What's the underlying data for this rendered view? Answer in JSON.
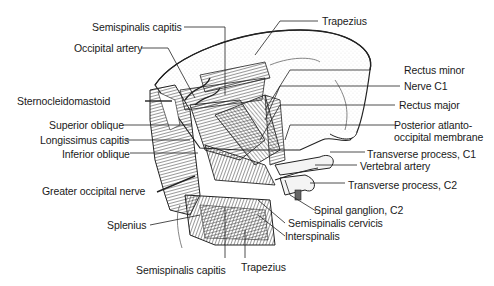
{
  "figure": {
    "labels": {
      "semispinalis_capitis_top": "Semispinalis capitis",
      "trapezius_top": "Trapezius",
      "occipital_artery": "Occipital artery",
      "sternocleidomastoid": "Sternocleidomastoid",
      "superior_oblique": "Superior oblique",
      "longissimus_capitis": "Longissimus capitis",
      "inferior_oblique": "Inferior oblique",
      "greater_occipital_nerve": "Greater occipital nerve",
      "splenius": "Splenius",
      "semispinalis_capitis_bottom": "Semispinalis capitis",
      "trapezius_bottom": "Trapezius",
      "rectus_minor": "Rectus minor",
      "nerve_c1": "Nerve C1",
      "rectus_major": "Rectus major",
      "posterior_atlanto_1": "Posterior atlanto-",
      "posterior_atlanto_2": "occipital membrane",
      "transverse_process_c1": "Transverse process, C1",
      "vertebral_artery": "Vertebral artery",
      "transverse_process_c2": "Transverse process, C2",
      "spinal_ganglion_c2": "Spinal ganglion, C2",
      "semispinalis_cervicis": "Semispinalis cervicis",
      "interspinalis": "Interspinalis"
    }
  }
}
